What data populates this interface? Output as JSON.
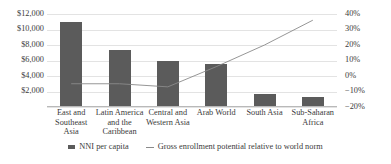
{
  "chart_data": {
    "type": "bar",
    "title": "",
    "subtitle": "",
    "xlabel": "",
    "categories": [
      "East and Southeast Asia",
      "Latin America and the Caribbean",
      "Central and Western Asia",
      "Arab World",
      "South Asia",
      "Sub-Saharan Africa"
    ],
    "category_lines": [
      [
        "East and",
        "Southeast",
        "Asia"
      ],
      [
        "Latin America",
        "and the",
        "Caribbean"
      ],
      [
        "Central and",
        "Western Asia"
      ],
      [
        "Arab World"
      ],
      [
        "South Asia"
      ],
      [
        "Sub-Saharan",
        "Africa"
      ]
    ],
    "series": [
      {
        "name": "NNI per capita",
        "type": "bar",
        "axis": "left",
        "color": "#5b5b5b",
        "values": [
          11000,
          7400,
          5900,
          5500,
          1700,
          1300
        ]
      },
      {
        "name": "Gross enrollment potential relative to world norm",
        "type": "line",
        "axis": "right",
        "color": "#8a8a8a",
        "values": [
          -5,
          -5,
          -7,
          6,
          20,
          36
        ]
      }
    ],
    "left_axis": {
      "label": "",
      "ylim": [
        0,
        12000
      ],
      "ticks": [
        2000,
        4000,
        6000,
        8000,
        10000,
        12000
      ],
      "tick_labels": [
        "$2,000",
        "$4,000",
        "$6,000",
        "$8,000",
        "$10,000",
        "$12,000"
      ]
    },
    "right_axis": {
      "label": "",
      "ylim": [
        -20,
        40
      ],
      "ticks": [
        -20,
        -10,
        0,
        10,
        20,
        30,
        40
      ],
      "tick_labels": [
        "−20%",
        "−10%",
        "0%",
        "10%",
        "20%",
        "30%",
        "40%"
      ]
    },
    "grid": true,
    "legend_position": "bottom",
    "legend": [
      {
        "label": "NNI per capita",
        "marker": "bar-swatch"
      },
      {
        "label": "Gross enrollment potential relative to world norm",
        "marker": "line-swatch"
      }
    ]
  }
}
